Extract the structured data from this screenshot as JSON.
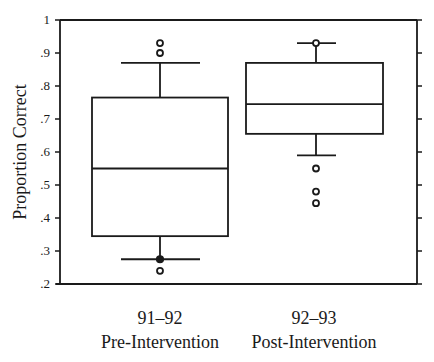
{
  "chart_data": {
    "type": "boxplot",
    "title": "",
    "xlabel": "",
    "ylabel": "Proportion Correct",
    "ylim": [
      0.2,
      1.0
    ],
    "yticks": [
      1.0,
      0.9,
      0.8,
      0.7,
      0.6,
      0.5,
      0.4,
      0.3,
      0.2
    ],
    "ytick_labels": [
      "1",
      ".9",
      ".8",
      ".7",
      ".6",
      ".5",
      ".4",
      ".3",
      ".2"
    ],
    "grid": false,
    "legend": null,
    "categories": [
      "91–92",
      "92–93"
    ],
    "category_sublabels": [
      "Pre-Intervention",
      "Post-Intervention"
    ],
    "series": [
      {
        "name": "Pre-Intervention",
        "year": "91–92",
        "whisker_low": 0.275,
        "q1": 0.345,
        "median": 0.55,
        "q3": 0.765,
        "whisker_high": 0.87,
        "outliers": [
          0.93,
          0.9,
          0.24
        ],
        "marked_points": [
          0.275
        ]
      },
      {
        "name": "Post-Intervention",
        "year": "92–93",
        "whisker_low": 0.59,
        "q1": 0.655,
        "median": 0.745,
        "q3": 0.87,
        "whisker_high": 0.93,
        "outliers": [
          0.93,
          0.55,
          0.48,
          0.445
        ],
        "marked_points": []
      }
    ]
  },
  "axis": {
    "ylabel": "Proportion Correct",
    "ticks": [
      {
        "value": 1.0,
        "label": "1"
      },
      {
        "value": 0.9,
        "label": ".9"
      },
      {
        "value": 0.8,
        "label": ".8"
      },
      {
        "value": 0.7,
        "label": ".7"
      },
      {
        "value": 0.6,
        "label": ".6"
      },
      {
        "value": 0.5,
        "label": ".5"
      },
      {
        "value": 0.4,
        "label": ".4"
      },
      {
        "value": 0.3,
        "label": ".3"
      },
      {
        "value": 0.2,
        "label": ".2"
      }
    ]
  },
  "colors": {
    "line": "#1a1a1a",
    "background": "#ffffff"
  }
}
